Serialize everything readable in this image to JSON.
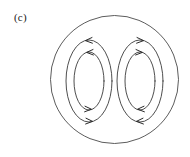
{
  "figure": {
    "panel_label": "(c)",
    "background_color": "#ffffff",
    "line_color": "#3a3a3a",
    "boundary_color": "#4a4a4a",
    "arrow_color": "#2b2b2b"
  },
  "chart_data": {
    "type": "diagram",
    "title": "(c)",
    "subtitle": "",
    "xlabel": "",
    "ylabel": "",
    "grid": false,
    "legend": false,
    "boundary": {
      "shape": "circle",
      "center_x": 114.5,
      "center_y": 79.5,
      "radius": 64
    },
    "cells": [
      {
        "name": "left-vortex",
        "rotation": "counterclockwise",
        "center_x": 89,
        "center_y": 81,
        "streamlines": [
          {
            "name": "left-outer-streamline",
            "rx": 23,
            "ry": 41,
            "arrows": [
              {
                "at": "top",
                "direction": "left",
                "x": 88,
                "y": 44
              },
              {
                "at": "bottom",
                "direction": "right",
                "x": 90,
                "y": 119
              }
            ]
          },
          {
            "name": "left-inner-streamline",
            "rx": 15,
            "ry": 29,
            "arrows": [
              {
                "at": "top",
                "direction": "left",
                "x": 90,
                "y": 57
              },
              {
                "at": "bottom",
                "direction": "right",
                "x": 89,
                "y": 106
              }
            ]
          }
        ]
      },
      {
        "name": "right-vortex",
        "rotation": "clockwise",
        "center_x": 140,
        "center_y": 81,
        "streamlines": [
          {
            "name": "right-outer-streamline",
            "rx": 23,
            "ry": 41,
            "arrows": [
              {
                "at": "top",
                "direction": "right",
                "x": 141,
                "y": 44
              },
              {
                "at": "bottom",
                "direction": "left",
                "x": 139,
                "y": 119
              }
            ]
          },
          {
            "name": "right-inner-streamline",
            "rx": 15,
            "ry": 29,
            "arrows": [
              {
                "at": "top",
                "direction": "right",
                "x": 139,
                "y": 57
              },
              {
                "at": "bottom",
                "direction": "left",
                "x": 140,
                "y": 106
              }
            ]
          }
        ]
      }
    ]
  }
}
